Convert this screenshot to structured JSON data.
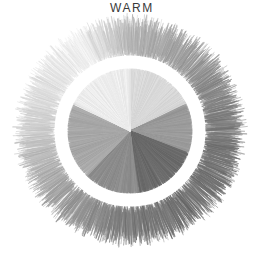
{
  "chart_data": {
    "type": "pie",
    "title": "WARM",
    "subtitle": "",
    "xlabel": "",
    "ylabel": "",
    "style": "hand-drawn-sketch",
    "background_color": "#ffffff",
    "center": {
      "cx": 130,
      "cy": 131
    },
    "legend": {
      "visible": false,
      "position": "none"
    },
    "grid": false,
    "rings": [
      {
        "name": "inner-pie",
        "inner_radius": 0,
        "outer_radius": 64,
        "start_angle_deg": -90,
        "total_deg": 360,
        "slices": [
          {
            "label": "slice-1",
            "value": 18,
            "angle_deg": 65,
            "color": "#d8d8d8"
          },
          {
            "label": "slice-2",
            "value": 13,
            "angle_deg": 46,
            "color": "#9a9a9a"
          },
          {
            "label": "slice-3",
            "value": 17,
            "angle_deg": 62,
            "color": "#6c6c6c"
          },
          {
            "label": "slice-4",
            "value": 14,
            "angle_deg": 51,
            "color": "#8e8e8e"
          },
          {
            "label": "slice-5",
            "value": 20,
            "angle_deg": 72,
            "color": "#a8a8a8"
          },
          {
            "label": "slice-6",
            "value": 18,
            "angle_deg": 64,
            "color": "#ececec"
          }
        ]
      },
      {
        "name": "outer-ring",
        "inner_radius": 74,
        "outer_radius": 113,
        "start_angle_deg": -90,
        "total_deg": 360,
        "slices": [
          {
            "label": "outer-1",
            "value": 8,
            "angle_deg": 30,
            "color": "#b4b4b4"
          },
          {
            "label": "outer-2",
            "value": 8,
            "angle_deg": 30,
            "color": "#9d9d9d"
          },
          {
            "label": "outer-3",
            "value": 8,
            "angle_deg": 30,
            "color": "#888888"
          },
          {
            "label": "outer-4",
            "value": 8,
            "angle_deg": 30,
            "color": "#787878"
          },
          {
            "label": "outer-5",
            "value": 8,
            "angle_deg": 30,
            "color": "#707070"
          },
          {
            "label": "outer-6",
            "value": 8,
            "angle_deg": 30,
            "color": "#6e6e6e"
          },
          {
            "label": "outer-7",
            "value": 8,
            "angle_deg": 30,
            "color": "#787878"
          },
          {
            "label": "outer-8",
            "value": 8,
            "angle_deg": 30,
            "color": "#8c8c8c"
          },
          {
            "label": "outer-9",
            "value": 8,
            "angle_deg": 30,
            "color": "#a8a8a8"
          },
          {
            "label": "outer-10",
            "value": 8,
            "angle_deg": 30,
            "color": "#c8c8c8"
          },
          {
            "label": "outer-11",
            "value": 8,
            "angle_deg": 30,
            "color": "#e2e2e2"
          },
          {
            "label": "outer-12",
            "value": 8,
            "angle_deg": 30,
            "color": "#f0f0f0"
          }
        ]
      }
    ],
    "annotations": []
  }
}
